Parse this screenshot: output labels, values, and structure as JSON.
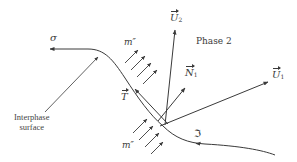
{
  "diagram": {
    "labels": {
      "sigma": "σ",
      "mass_flux_top": "m″",
      "mass_flux_bottom": "m″",
      "phase2": "Phase 2",
      "U2": "U",
      "U2_sub": "2",
      "N1": "N",
      "N1_sub": "1",
      "U1": "U",
      "U1_sub": "1",
      "T": "T",
      "interphase_line1": "Interphase",
      "interphase_line2": "surface",
      "curvature": "ℑ"
    },
    "colors": {
      "line": "#3a3a3a",
      "background": "#ffffff"
    }
  }
}
